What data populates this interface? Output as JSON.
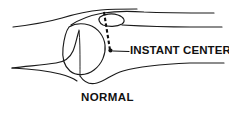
{
  "figure": {
    "title_label": "NORMAL",
    "annotation_label": "INSTANT CENTER",
    "colors": {
      "background": "#ffffff",
      "line": "#1a1a1a",
      "text": "#111111",
      "dash": "#111111"
    },
    "annotation": {
      "marker": "instant-center-dot",
      "marker_position": [
        110,
        50
      ],
      "dashed_axis_start": [
        104,
        12
      ],
      "dashed_axis_end": [
        110,
        50
      ],
      "leader_start": [
        113,
        51
      ],
      "leader_end": [
        129,
        51
      ]
    },
    "parts": [
      {
        "name": "femur-shaft-superior-cortex",
        "kind": "outline"
      },
      {
        "name": "femur-shaft-inferior-cortex",
        "kind": "outline"
      },
      {
        "name": "femoral-condyle",
        "kind": "outline"
      },
      {
        "name": "patella",
        "kind": "outline"
      },
      {
        "name": "quadriceps-patellar-tendon-line",
        "kind": "outline"
      },
      {
        "name": "tibial-plateau",
        "kind": "outline"
      },
      {
        "name": "tibia-shaft-superior-cortex",
        "kind": "outline"
      },
      {
        "name": "tibia-shaft-inferior-cortex",
        "kind": "outline"
      },
      {
        "name": "intercondylar-notch",
        "kind": "outline"
      }
    ]
  }
}
